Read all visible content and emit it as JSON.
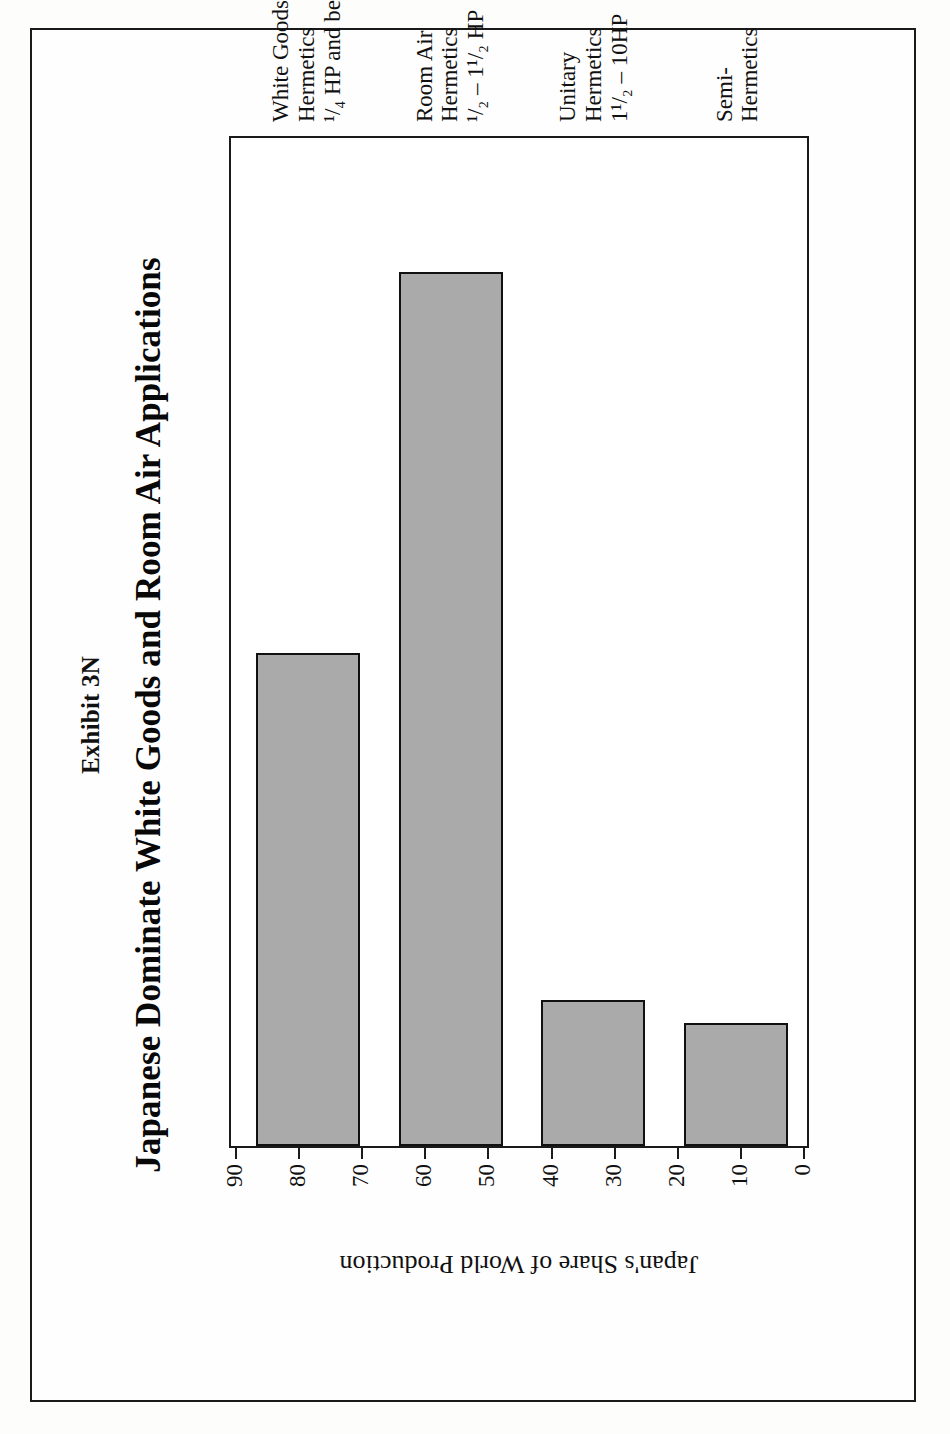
{
  "document": {
    "exhibit_label": "Exhibit 3N",
    "page_border_color": "#1a1a1a",
    "background_color": "#fefefe"
  },
  "chart_data": {
    "type": "bar",
    "orientation": "horizontal",
    "title": "Japanese Dominate White Goods and Room Air Applications",
    "xlabel": "",
    "ylabel": "Japan's Share of World Production",
    "ylim": [
      0,
      90
    ],
    "tick_step": 10,
    "grid": false,
    "legend": null,
    "bar_fill_color": "#aaaaaa",
    "bar_border_color": "#111111",
    "tick_labels": [
      "0",
      "10",
      "20",
      "30",
      "40",
      "50",
      "60",
      "70",
      "80",
      "90"
    ],
    "categories": [
      "White Goods Hermetics 1/4 HP and below",
      "Room Air Hermetics 1/2 - 1 1/2 HP",
      "Unitary Hermetics 1 1/2 - 10HP",
      "Semi-Hermetics"
    ],
    "category_label_lines": [
      [
        "White Goods",
        "Hermetics",
        "¹/₄ HP and below"
      ],
      [
        "Room Air",
        "Hermetics",
        "¹/₂ – 1¹/₂ HP"
      ],
      [
        "Unitary",
        "Hermetics",
        "1¹/₂ – 10HP"
      ],
      [
        "Semi-",
        "Hermetics",
        ""
      ]
    ],
    "values": [
      44,
      78,
      13,
      11
    ]
  }
}
